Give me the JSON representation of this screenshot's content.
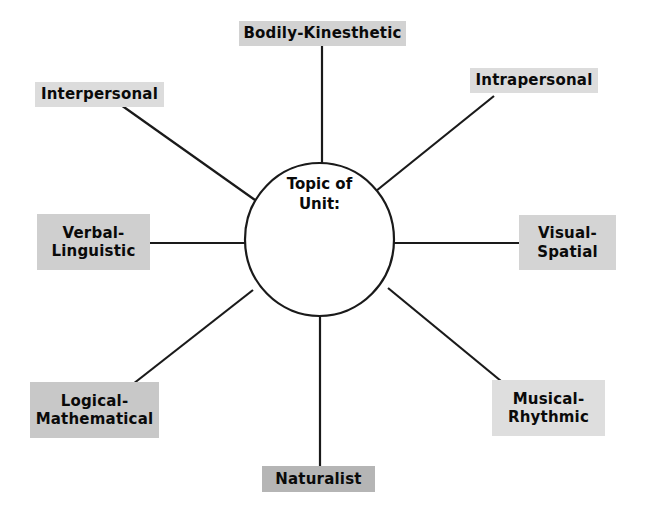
{
  "diagram": {
    "center": {
      "line1": "Topic of",
      "line2": "Unit:",
      "shape": "ellipse",
      "fill": "#ffffff",
      "stroke": "#1a1a1a"
    },
    "line_color": "#1a1a1a",
    "background": "#ffffff",
    "nodes": [
      {
        "id": "bodily-kinesthetic",
        "line1": "Bodily-Kinesthetic",
        "line2": "",
        "fill": "#d2d2d2",
        "box": {
          "left": 239,
          "top": 21,
          "width": 167,
          "height": 25
        },
        "connector": {
          "x1": 322,
          "y1": 46,
          "x2": 322,
          "y2": 164
        }
      },
      {
        "id": "intrapersonal",
        "line1": "Intrapersonal",
        "line2": "",
        "fill": "#dcdcdc",
        "box": {
          "left": 470,
          "top": 68,
          "width": 128,
          "height": 25
        },
        "connector": {
          "x1": 494,
          "y1": 96,
          "x2": 376,
          "y2": 191
        }
      },
      {
        "id": "visual-spatial",
        "line1": "Visual-",
        "line2": "Spatial",
        "fill": "#d4d4d4",
        "box": {
          "left": 519,
          "top": 215,
          "width": 97,
          "height": 55
        },
        "connector": {
          "x1": 519,
          "y1": 243,
          "x2": 394,
          "y2": 243
        }
      },
      {
        "id": "musical-rhythmic",
        "line1": "Musical-",
        "line2": "Rhythmic",
        "fill": "#dedede",
        "box": {
          "left": 492,
          "top": 380,
          "width": 113,
          "height": 56
        },
        "connector": {
          "x1": 501,
          "y1": 381,
          "x2": 388,
          "y2": 288
        }
      },
      {
        "id": "naturalist",
        "line1": "Naturalist",
        "line2": "",
        "fill": "#b5b5b5",
        "box": {
          "left": 262,
          "top": 466,
          "width": 113,
          "height": 26
        },
        "connector": {
          "x1": 320,
          "y1": 466,
          "x2": 320,
          "y2": 316
        }
      },
      {
        "id": "logical-mathematical",
        "line1": "Logical-",
        "line2": "Mathematical",
        "fill": "#c8c8c8",
        "box": {
          "left": 30,
          "top": 382,
          "width": 129,
          "height": 56
        },
        "connector": {
          "x1": 133,
          "y1": 384,
          "x2": 253,
          "y2": 290
        }
      },
      {
        "id": "verbal-linguistic",
        "line1": "Verbal-",
        "line2": "Linguistic",
        "fill": "#cfcfcf",
        "box": {
          "left": 37,
          "top": 214,
          "width": 113,
          "height": 56
        },
        "connector": {
          "x1": 150,
          "y1": 243,
          "x2": 245,
          "y2": 243
        }
      },
      {
        "id": "interpersonal",
        "line1": "Interpersonal",
        "line2": "",
        "fill": "#dcdcdc",
        "box": {
          "left": 35,
          "top": 82,
          "width": 129,
          "height": 25
        },
        "connector": {
          "x1": 121,
          "y1": 105,
          "x2": 255,
          "y2": 200
        }
      }
    ]
  }
}
